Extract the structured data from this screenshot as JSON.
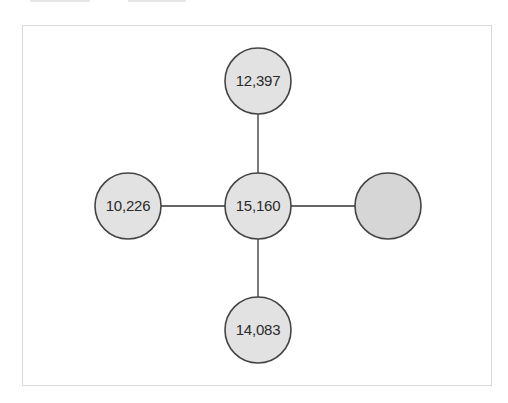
{
  "diagram": {
    "type": "star-network",
    "colors": {
      "node_fill": "#e2e2e2",
      "node_fill_empty": "#d6d6d6",
      "node_stroke": "#444444",
      "edge_stroke": "#333333",
      "frame_border": "#d9d9d9"
    },
    "nodes": [
      {
        "id": "center",
        "label": "15,160",
        "cx": 258,
        "cy": 206,
        "r": 33
      },
      {
        "id": "top",
        "label": "12,397",
        "cx": 258,
        "cy": 81,
        "r": 33
      },
      {
        "id": "left",
        "label": "10,226",
        "cx": 128,
        "cy": 206,
        "r": 33
      },
      {
        "id": "bottom",
        "label": "14,083",
        "cx": 258,
        "cy": 330,
        "r": 33
      },
      {
        "id": "right",
        "label": "",
        "cx": 388,
        "cy": 206,
        "r": 33
      }
    ],
    "edges": [
      {
        "from": "center",
        "to": "top"
      },
      {
        "from": "center",
        "to": "left"
      },
      {
        "from": "center",
        "to": "bottom"
      },
      {
        "from": "center",
        "to": "right"
      }
    ]
  }
}
